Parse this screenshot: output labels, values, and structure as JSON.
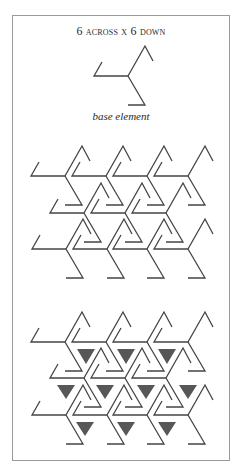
{
  "title": "6 across x 6 down",
  "caption": "base element",
  "colors": {
    "line": "#444444",
    "triangle": "#575757",
    "frame": "#9a9a9a",
    "background": "#ffffff"
  },
  "element_geometry": {
    "arm_length": 34,
    "hook_length": 17,
    "arms": [
      {
        "name": "left-arm",
        "points": [
          [
            0,
            0
          ],
          [
            -34,
            0
          ],
          [
            -26,
            -14
          ]
        ]
      },
      {
        "name": "up-arm",
        "points": [
          [
            0,
            0
          ],
          [
            17,
            -30
          ],
          [
            25,
            -15
          ]
        ]
      },
      {
        "name": "down-arm",
        "points": [
          [
            0,
            0
          ],
          [
            17,
            29
          ],
          [
            0,
            29
          ]
        ]
      }
    ]
  },
  "base_element": {
    "cx": 128,
    "cy": 76
  },
  "tiling_panel": {
    "rows": [
      {
        "cy": 176,
        "xs": [
          65,
          106,
          147,
          188
        ]
      },
      {
        "cy": 213,
        "xs": [
          84,
          125,
          166
        ]
      },
      {
        "cy": 249,
        "xs": [
          66,
          107,
          147,
          188
        ]
      }
    ]
  },
  "filled_panel": {
    "rows": [
      {
        "cy": 342,
        "xs": [
          65,
          106,
          147,
          188
        ]
      },
      {
        "cy": 378,
        "xs": [
          84,
          125,
          166
        ]
      },
      {
        "cy": 415,
        "xs": [
          66,
          107,
          147,
          188
        ]
      }
    ],
    "triangles": [
      {
        "cx": 86,
        "top": 349,
        "apex": 364
      },
      {
        "cx": 126,
        "top": 349,
        "apex": 364
      },
      {
        "cx": 167,
        "top": 349,
        "apex": 364
      },
      {
        "cx": 66,
        "top": 385,
        "apex": 399
      },
      {
        "cx": 105,
        "top": 385,
        "apex": 399
      },
      {
        "cx": 146,
        "top": 385,
        "apex": 399
      },
      {
        "cx": 188,
        "top": 385,
        "apex": 399
      },
      {
        "cx": 85,
        "top": 422,
        "apex": 436
      },
      {
        "cx": 126,
        "top": 422,
        "apex": 436
      },
      {
        "cx": 167,
        "top": 422,
        "apex": 436
      }
    ],
    "triangle_half_width": 9
  }
}
